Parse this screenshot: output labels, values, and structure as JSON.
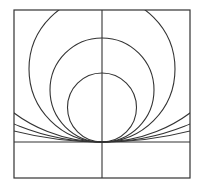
{
  "diagram": {
    "stroke_color": "#333333",
    "background": "#ffffff",
    "frame": {
      "x": 14,
      "y": 10,
      "width": 176,
      "height": 168
    },
    "tangent_point": {
      "x": 102,
      "y": 142
    },
    "horizontal_line_y": 142,
    "vertical_line_x": 102,
    "circle_radii": [
      34.5,
      52,
      73,
      148,
      224,
      357
    ]
  }
}
